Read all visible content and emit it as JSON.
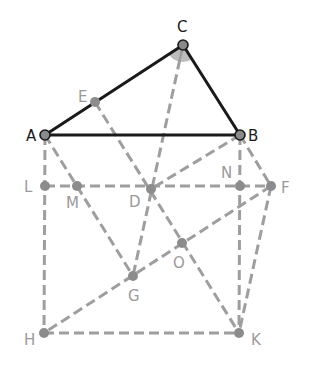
{
  "diagram": {
    "type": "geometry-construction",
    "colors": {
      "solid_line": "#1a1a1a",
      "dashed_line": "#9e9e9e",
      "point_fill": "#8a8a8a",
      "main_label": "#1a1a1a",
      "aux_label": "#9a9a9a",
      "angle_fill": "#bdbdbd"
    },
    "points": {
      "A": {
        "x": 45,
        "y": 135,
        "label": "A",
        "lx": 26,
        "ly": 141,
        "main": true
      },
      "B": {
        "x": 240,
        "y": 135,
        "label": "B",
        "lx": 248,
        "ly": 141,
        "main": true
      },
      "C": {
        "x": 183,
        "y": 45,
        "label": "C",
        "lx": 177,
        "ly": 32,
        "main": true
      },
      "E": {
        "x": 95,
        "y": 102,
        "label": "E",
        "lx": 78,
        "ly": 102,
        "main": false
      },
      "L": {
        "x": 45,
        "y": 186,
        "label": "L",
        "lx": 24,
        "ly": 192,
        "main": false
      },
      "M": {
        "x": 77,
        "y": 186,
        "label": "M",
        "lx": 66,
        "ly": 208,
        "main": false
      },
      "D": {
        "x": 151,
        "y": 189,
        "label": "D",
        "lx": 129,
        "ly": 207,
        "main": false
      },
      "N": {
        "x": 240,
        "y": 186,
        "label": "N",
        "lx": 221,
        "ly": 178,
        "main": false
      },
      "F": {
        "x": 271,
        "y": 186,
        "label": "F",
        "lx": 281,
        "ly": 193,
        "main": false
      },
      "O": {
        "x": 182,
        "y": 243,
        "label": "O",
        "lx": 173,
        "ly": 268,
        "main": false
      },
      "G": {
        "x": 133,
        "y": 276,
        "label": "G",
        "lx": 128,
        "ly": 301,
        "main": false
      },
      "H": {
        "x": 44,
        "y": 333,
        "label": "H",
        "lx": 24,
        "ly": 345,
        "main": false
      },
      "K": {
        "x": 239,
        "y": 333,
        "label": "K",
        "lx": 251,
        "ly": 345,
        "main": false
      }
    },
    "segments_solid": [
      [
        "A",
        "B"
      ],
      [
        "A",
        "C"
      ],
      [
        "C",
        "B"
      ]
    ],
    "segments_dashed": [
      [
        "C",
        "G"
      ],
      [
        "E",
        "K"
      ],
      [
        "A",
        "H"
      ],
      [
        "A",
        "G"
      ],
      [
        "B",
        "D"
      ],
      [
        "B",
        "K"
      ],
      [
        "B",
        "F"
      ],
      [
        "L",
        "F"
      ],
      [
        "F",
        "H"
      ],
      [
        "F",
        "K"
      ],
      [
        "H",
        "K"
      ]
    ],
    "angle_mark": {
      "vertex": "C",
      "radius": 17,
      "from": "A",
      "to": "B"
    }
  }
}
